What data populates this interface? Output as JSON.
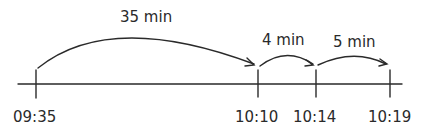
{
  "diagram": {
    "type": "number-line",
    "ticks": [
      {
        "label": "09:35"
      },
      {
        "label": "10:10"
      },
      {
        "label": "10:14"
      },
      {
        "label": "10:19"
      }
    ],
    "jumps": [
      {
        "label": "35 min",
        "from": "09:35",
        "to": "10:10"
      },
      {
        "label": "4 min",
        "from": "10:10",
        "to": "10:14"
      },
      {
        "label": "5 min",
        "from": "10:14",
        "to": "10:19"
      }
    ],
    "line_color": "#2a2a2a"
  }
}
